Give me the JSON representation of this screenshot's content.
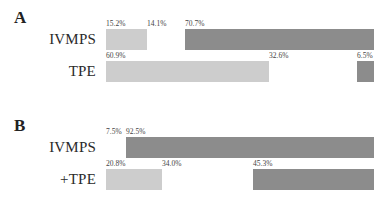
{
  "panels": [
    {
      "letter": "A",
      "rows": [
        {
          "label": "IVMPS",
          "segments": [
            {
              "value": 15.2,
              "text": "15.2%",
              "shade": "light"
            },
            {
              "value": 14.1,
              "text": "14.1%",
              "shade": "blank"
            },
            {
              "value": 70.7,
              "text": "70.7%",
              "shade": "dark"
            }
          ]
        },
        {
          "label": "TPE",
          "segments": [
            {
              "value": 60.9,
              "text": "60.9%",
              "shade": "light"
            },
            {
              "value": 32.6,
              "text": "32.6%",
              "shade": "blank"
            },
            {
              "value": 6.5,
              "text": "6.5%",
              "shade": "dark"
            }
          ]
        }
      ]
    },
    {
      "letter": "B",
      "rows": [
        {
          "label": "IVMPS",
          "segments": [
            {
              "value": 7.5,
              "text": "7.5%",
              "shade": "blank"
            },
            {
              "value": 92.5,
              "text": "92.5%",
              "shade": "dark"
            }
          ]
        },
        {
          "label": "+TPE",
          "segments": [
            {
              "value": 20.8,
              "text": "20.8%",
              "shade": "light"
            },
            {
              "value": 34.0,
              "text": "34.0%",
              "shade": "blank"
            },
            {
              "value": 45.3,
              "text": "45.3%",
              "shade": "dark"
            }
          ]
        }
      ]
    }
  ],
  "colors": {
    "light": "#cdcdcd",
    "dark": "#8c8c8c",
    "blank": "#ffffff"
  },
  "chart_data": [
    {
      "type": "bar",
      "orientation": "horizontal",
      "stacked": true,
      "title": "A",
      "categories": [
        "IVMPS",
        "TPE"
      ],
      "series": [
        {
          "name": "light segment",
          "values": [
            15.2,
            60.9
          ]
        },
        {
          "name": "blank segment",
          "values": [
            14.1,
            32.6
          ]
        },
        {
          "name": "dark segment",
          "values": [
            70.7,
            6.5
          ]
        }
      ],
      "xlabel": "",
      "ylabel": "",
      "xlim": [
        0,
        100
      ],
      "grid": false,
      "legend": "none"
    },
    {
      "type": "bar",
      "orientation": "horizontal",
      "stacked": true,
      "title": "B",
      "categories": [
        "IVMPS",
        "+TPE"
      ],
      "series": [
        {
          "name": "light segment",
          "values": [
            0,
            20.8
          ]
        },
        {
          "name": "blank segment",
          "values": [
            7.5,
            34.0
          ]
        },
        {
          "name": "dark segment",
          "values": [
            92.5,
            45.3
          ]
        }
      ],
      "xlabel": "",
      "ylabel": "",
      "xlim": [
        0,
        100
      ],
      "grid": false,
      "legend": "none"
    }
  ]
}
